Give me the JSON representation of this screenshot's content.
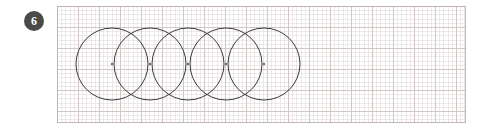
{
  "canvas": {
    "width": 486,
    "height": 131,
    "background_color": "#ffffff"
  },
  "step_badge": {
    "label": "6",
    "shape": "circle",
    "background_color": "#4a4a4a",
    "text_color": "#ffffff",
    "x": 24,
    "y": 11,
    "diameter": 20
  },
  "grid_paper": {
    "x": 57,
    "y": 6,
    "width": 409,
    "height": 117,
    "major_spacing": 21,
    "minor_spacing": 4.2,
    "major_line_color": "#c4b6b6",
    "minor_line_color": "#d7cdcd",
    "border_color": "#beb0b0",
    "background_color": "#ffffff"
  },
  "drawing": {
    "name": "overlapping-circles-chain",
    "stroke_color": "#3a3a3a",
    "stroke_width": 1,
    "fill": "none",
    "center_dot_color": "#6b6b6b",
    "center_dot_radius": 1.2,
    "circle_radius": 36,
    "center_y": 64,
    "center_x_spacing": 38,
    "circles": [
      {
        "id": "circle-1",
        "cx": 112,
        "cy": 64,
        "r": 36
      },
      {
        "id": "circle-2",
        "cx": 150,
        "cy": 64,
        "r": 36
      },
      {
        "id": "circle-3",
        "cx": 188,
        "cy": 64,
        "r": 36
      },
      {
        "id": "circle-4",
        "cx": 226,
        "cy": 64,
        "r": 36
      },
      {
        "id": "circle-5",
        "cx": 264,
        "cy": 64,
        "r": 36
      }
    ],
    "center_dots": [
      {
        "cx": 112,
        "cy": 64
      },
      {
        "cx": 150,
        "cy": 64
      },
      {
        "cx": 188,
        "cy": 64
      },
      {
        "cx": 226,
        "cy": 64
      },
      {
        "cx": 264,
        "cy": 64
      }
    ]
  }
}
